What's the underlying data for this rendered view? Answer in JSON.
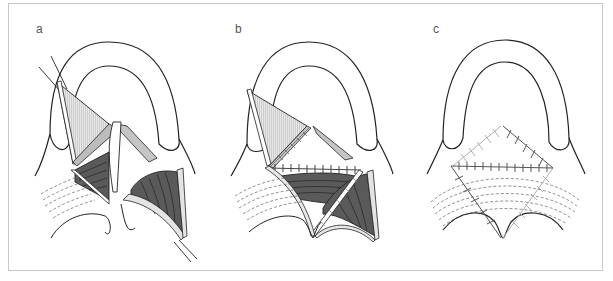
{
  "figure": {
    "panels": [
      {
        "id": "a",
        "label": "a",
        "description": "Flaps incised and elevated from palate"
      },
      {
        "id": "b",
        "label": "b",
        "description": "Flaps rotated and partially sutured"
      },
      {
        "id": "c",
        "label": "c",
        "description": "Final suture lines after closure"
      }
    ]
  },
  "colors": {
    "outline": "#222222",
    "flap_light": "#dcdcdc",
    "flap_mid": "#b8b8b8",
    "muscle_dark": "#5a5a5a",
    "suture_dark": "#555555",
    "suture_light": "#b0b0b0",
    "dashed": "#777777",
    "frame_border": "#c8c8c8"
  }
}
